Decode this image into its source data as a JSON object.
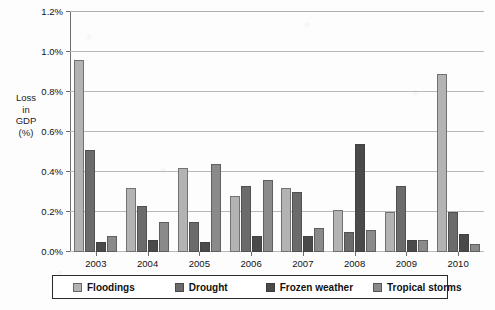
{
  "chart_data": {
    "type": "bar",
    "title": "",
    "subtitle": "",
    "xlabel": "",
    "ylabel": "Loss in GDP (%)",
    "ylabel_lines": [
      "Loss",
      "in",
      "GDP",
      "(%)"
    ],
    "ylim": [
      0,
      1.2
    ],
    "ytick_labels": [
      "0.0%",
      "0.2%",
      "0.4%",
      "0.6%",
      "0.8%",
      "1.0%",
      "1.2%"
    ],
    "ytick_values": [
      0.0,
      0.2,
      0.4,
      0.6,
      0.8,
      1.0,
      1.2
    ],
    "grid": true,
    "grid_axis": "y",
    "legend_position": "bottom",
    "categories": [
      "2003",
      "2004",
      "2005",
      "2006",
      "2007",
      "2008",
      "2009",
      "2010"
    ],
    "series": [
      {
        "name": "Floodings",
        "color": "#b3b3b3",
        "values": [
          0.96,
          0.32,
          0.42,
          0.28,
          0.32,
          0.21,
          0.2,
          0.89
        ]
      },
      {
        "name": "Drought",
        "color": "#6b6b6b",
        "values": [
          0.51,
          0.23,
          0.15,
          0.33,
          0.3,
          0.1,
          0.33,
          0.2
        ]
      },
      {
        "name": "Frozen weather",
        "color": "#4a4a4a",
        "values": [
          0.05,
          0.06,
          0.05,
          0.08,
          0.08,
          0.54,
          0.06,
          0.09
        ]
      },
      {
        "name": "Tropical storms",
        "color": "#8a8a8a",
        "values": [
          0.08,
          0.15,
          0.44,
          0.36,
          0.12,
          0.11,
          0.06,
          0.04
        ]
      }
    ]
  },
  "axis_title": {
    "line1": "Loss",
    "line2": "in",
    "line3": "GDP",
    "line4": "(%)"
  },
  "legend": {
    "items": [
      {
        "label": "Floodings"
      },
      {
        "label": "Drought"
      },
      {
        "label": "Frozen weather"
      },
      {
        "label": "Tropical storms"
      }
    ]
  }
}
